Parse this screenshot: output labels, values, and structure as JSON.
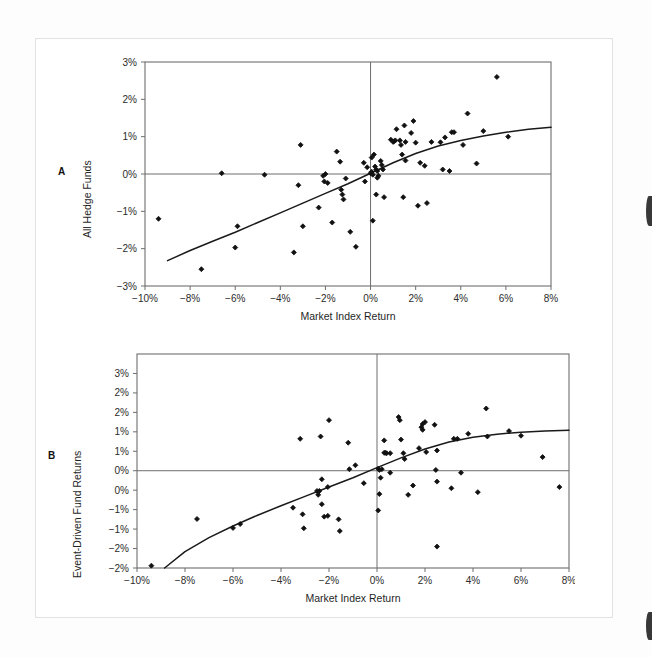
{
  "page": {
    "background_color": "#ffffff",
    "frame_color": "#e3e3e3",
    "axis_color": "#6e6e6e",
    "marker_color": "#111111",
    "curve_color": "#1a1a1a"
  },
  "panels": [
    {
      "letter": "A",
      "name": "panel-a-label"
    },
    {
      "letter": "B",
      "name": "panel-b-label"
    }
  ],
  "chart_data": [
    {
      "type": "scatter",
      "panel": "A",
      "title": "",
      "xlabel": "Market Index Return",
      "ylabel": "All Hedge Funds",
      "xlim": [
        -10,
        8
      ],
      "ylim": [
        -3,
        3
      ],
      "xticks": [
        -10,
        -8,
        -6,
        -4,
        -2,
        0,
        2,
        4,
        6,
        8
      ],
      "xticklabels": [
        "−10%",
        "−8%",
        "−6%",
        "−4%",
        "−2%",
        "0%",
        "2%",
        "4%",
        "6%",
        "8%"
      ],
      "yticks": [
        -3,
        -2,
        -1,
        0,
        1,
        2,
        3
      ],
      "yticklabels": [
        "−3%",
        "−2%",
        "−1%",
        "0%",
        "1%",
        "2%",
        "3%"
      ],
      "grid": false,
      "zero_lines": {
        "x": 0,
        "y": 0
      },
      "legend": "none",
      "points": [
        [
          -9.4,
          -1.2
        ],
        [
          -7.5,
          -2.55
        ],
        [
          -6.6,
          0.02
        ],
        [
          -5.9,
          -1.4
        ],
        [
          -6.0,
          -1.97
        ],
        [
          -4.7,
          -0.02
        ],
        [
          -3.4,
          -2.1
        ],
        [
          -3.1,
          0.78
        ],
        [
          -3.2,
          -0.3
        ],
        [
          -3.0,
          -1.4
        ],
        [
          -2.3,
          -0.9
        ],
        [
          -2.1,
          -0.05
        ],
        [
          -2.0,
          0.0
        ],
        [
          -2.05,
          -0.2
        ],
        [
          -1.9,
          -0.24
        ],
        [
          -1.7,
          -1.3
        ],
        [
          -1.5,
          0.6
        ],
        [
          -1.35,
          0.33
        ],
        [
          -1.1,
          -0.12
        ],
        [
          -1.3,
          -0.42
        ],
        [
          -1.25,
          -0.55
        ],
        [
          -1.2,
          -0.68
        ],
        [
          -0.9,
          -1.55
        ],
        [
          -0.65,
          -1.95
        ],
        [
          -0.3,
          0.3
        ],
        [
          -0.15,
          0.18
        ],
        [
          -0.25,
          -0.2
        ],
        [
          0.0,
          0.02
        ],
        [
          0.05,
          0.06
        ],
        [
          0.1,
          -0.02
        ],
        [
          0.05,
          0.44
        ],
        [
          0.15,
          0.52
        ],
        [
          0.2,
          0.2
        ],
        [
          0.25,
          0.12
        ],
        [
          0.3,
          0.08
        ],
        [
          0.35,
          -0.05
        ],
        [
          0.3,
          -0.1
        ],
        [
          0.25,
          -0.55
        ],
        [
          0.1,
          -1.25
        ],
        [
          0.45,
          0.35
        ],
        [
          0.5,
          0.24
        ],
        [
          0.55,
          0.12
        ],
        [
          0.6,
          -0.62
        ],
        [
          0.9,
          0.92
        ],
        [
          1.0,
          0.86
        ],
        [
          1.05,
          0.88
        ],
        [
          1.1,
          0.9
        ],
        [
          1.15,
          1.2
        ],
        [
          1.3,
          0.9
        ],
        [
          1.35,
          0.78
        ],
        [
          1.4,
          0.52
        ],
        [
          1.5,
          1.3
        ],
        [
          1.55,
          0.86
        ],
        [
          1.55,
          0.36
        ],
        [
          1.45,
          -0.62
        ],
        [
          1.8,
          1.1
        ],
        [
          1.9,
          1.42
        ],
        [
          2.0,
          0.84
        ],
        [
          2.1,
          -0.85
        ],
        [
          2.2,
          0.3
        ],
        [
          2.4,
          0.22
        ],
        [
          2.5,
          -0.78
        ],
        [
          2.7,
          0.86
        ],
        [
          3.1,
          0.85
        ],
        [
          3.2,
          0.12
        ],
        [
          3.3,
          0.98
        ],
        [
          3.5,
          0.08
        ],
        [
          3.6,
          1.12
        ],
        [
          3.7,
          1.12
        ],
        [
          4.1,
          0.78
        ],
        [
          4.3,
          1.62
        ],
        [
          4.7,
          0.28
        ],
        [
          5.0,
          1.15
        ],
        [
          5.6,
          2.6
        ],
        [
          6.1,
          1.0
        ]
      ],
      "fit_curve": {
        "kind": "concave-increasing",
        "points": [
          [
            -9.0,
            -2.32
          ],
          [
            -8.0,
            -2.05
          ],
          [
            -7.0,
            -1.8
          ],
          [
            -6.0,
            -1.56
          ],
          [
            -5.0,
            -1.3
          ],
          [
            -4.0,
            -1.04
          ],
          [
            -3.0,
            -0.78
          ],
          [
            -2.0,
            -0.52
          ],
          [
            -1.0,
            -0.26
          ],
          [
            0.0,
            0.02
          ],
          [
            1.0,
            0.3
          ],
          [
            2.0,
            0.55
          ],
          [
            3.0,
            0.75
          ],
          [
            4.0,
            0.9
          ],
          [
            5.0,
            1.02
          ],
          [
            6.0,
            1.12
          ],
          [
            7.0,
            1.2
          ],
          [
            8.0,
            1.25
          ]
        ]
      }
    },
    {
      "type": "scatter",
      "panel": "B",
      "title": "",
      "xlabel": "Market Index Return",
      "ylabel": "Event-Driven Fund Returns",
      "xlim": [
        -10,
        8
      ],
      "ylim": [
        -2.5,
        3.0
      ],
      "xticks": [
        -10,
        -8,
        -6,
        -4,
        -2,
        0,
        2,
        4,
        6,
        8
      ],
      "xticklabels": [
        "−10%",
        "−8%",
        "−6%",
        "−4%",
        "−2%",
        "0%",
        "2%",
        "4%",
        "6%",
        "8%"
      ],
      "yticks": [
        -2.5,
        -2.0,
        -1.5,
        -1.0,
        -0.5,
        0.0,
        0.5,
        1.0,
        1.5,
        2.0,
        2.5,
        3.0
      ],
      "yticklabels": [
        "−2%",
        "−2%",
        "−1%",
        "−1%",
        "0%",
        "0%",
        "1%",
        "1%",
        "2%",
        "2%",
        "3%"
      ],
      "grid": false,
      "zero_lines": {
        "x": 0,
        "y": 0
      },
      "legend": "none",
      "points": [
        [
          -9.4,
          -2.44
        ],
        [
          -7.5,
          -1.24
        ],
        [
          -6.0,
          -1.47
        ],
        [
          -5.7,
          -1.37
        ],
        [
          -3.5,
          -0.95
        ],
        [
          -3.2,
          0.82
        ],
        [
          -3.1,
          -1.12
        ],
        [
          -3.05,
          -1.48
        ],
        [
          -2.3,
          -0.86
        ],
        [
          -2.2,
          -1.18
        ],
        [
          -2.05,
          -0.42
        ],
        [
          -2.0,
          1.3
        ],
        [
          -2.05,
          -1.16
        ],
        [
          -1.6,
          -1.25
        ],
        [
          -1.15,
          0.04
        ],
        [
          -1.2,
          0.72
        ],
        [
          -2.3,
          -0.22
        ],
        [
          -2.4,
          -0.52
        ],
        [
          -2.45,
          -0.62
        ],
        [
          -2.5,
          -0.52
        ],
        [
          -2.35,
          0.88
        ],
        [
          -1.55,
          -1.55
        ],
        [
          -0.9,
          0.14
        ],
        [
          -0.55,
          -0.32
        ],
        [
          0.05,
          0.05
        ],
        [
          0.1,
          0.02
        ],
        [
          0.15,
          -0.18
        ],
        [
          0.2,
          0.04
        ],
        [
          0.1,
          -0.6
        ],
        [
          0.05,
          -1.02
        ],
        [
          0.3,
          0.46
        ],
        [
          0.35,
          0.46
        ],
        [
          0.4,
          0.45
        ],
        [
          0.55,
          0.45
        ],
        [
          0.3,
          0.78
        ],
        [
          0.55,
          -0.05
        ],
        [
          0.9,
          1.38
        ],
        [
          0.95,
          1.3
        ],
        [
          1.0,
          0.8
        ],
        [
          1.1,
          0.45
        ],
        [
          1.15,
          0.3
        ],
        [
          1.3,
          -0.62
        ],
        [
          1.5,
          -0.38
        ],
        [
          1.75,
          0.58
        ],
        [
          1.85,
          1.12
        ],
        [
          1.9,
          1.2
        ],
        [
          1.9,
          1.05
        ],
        [
          2.0,
          1.25
        ],
        [
          2.05,
          0.48
        ],
        [
          2.4,
          1.18
        ],
        [
          2.5,
          0.52
        ],
        [
          2.45,
          0.02
        ],
        [
          2.5,
          -0.28
        ],
        [
          2.5,
          -1.95
        ],
        [
          3.1,
          -0.45
        ],
        [
          3.2,
          0.82
        ],
        [
          3.35,
          0.82
        ],
        [
          3.5,
          -0.05
        ],
        [
          3.8,
          0.95
        ],
        [
          4.2,
          -0.55
        ],
        [
          4.55,
          1.6
        ],
        [
          4.6,
          0.88
        ],
        [
          5.5,
          1.02
        ],
        [
          6.0,
          0.9
        ],
        [
          6.9,
          0.35
        ],
        [
          7.6,
          -0.42
        ]
      ],
      "fit_curve": {
        "kind": "concave-increasing",
        "points": [
          [
            -8.85,
            -2.5
          ],
          [
            -8.0,
            -2.08
          ],
          [
            -7.0,
            -1.72
          ],
          [
            -6.0,
            -1.42
          ],
          [
            -5.0,
            -1.15
          ],
          [
            -4.0,
            -0.9
          ],
          [
            -3.0,
            -0.66
          ],
          [
            -2.0,
            -0.42
          ],
          [
            -1.0,
            -0.18
          ],
          [
            0.0,
            0.08
          ],
          [
            1.0,
            0.33
          ],
          [
            2.0,
            0.56
          ],
          [
            3.0,
            0.74
          ],
          [
            4.0,
            0.86
          ],
          [
            5.0,
            0.94
          ],
          [
            6.0,
            0.99
          ],
          [
            7.0,
            1.02
          ],
          [
            8.0,
            1.04
          ]
        ]
      }
    }
  ]
}
